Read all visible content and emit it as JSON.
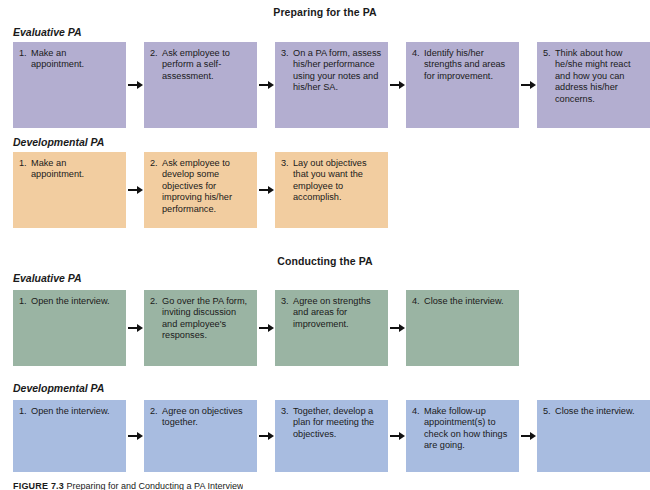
{
  "figure": {
    "caption_label": "FIGURE 7.3",
    "caption_text": "Preparing for and Conducting a PA Interview"
  },
  "colors": {
    "evaluative_preparing": "#b3aed0",
    "developmental_preparing": "#f2cda0",
    "evaluative_conducting": "#9ab4a3",
    "developmental_conducting": "#a8bce0",
    "arrow": "#111111",
    "text": "#1a1a1a",
    "background": "#ffffff"
  },
  "sections": [
    {
      "title": "Preparing for the PA",
      "rows": [
        {
          "label": "Evaluative PA",
          "color": "#b3aed0",
          "steps": [
            {
              "num": "1.",
              "text": "Make an appointment."
            },
            {
              "num": "2.",
              "text": "Ask employee to perform a self-assessment."
            },
            {
              "num": "3.",
              "text": "On a PA form, assess his/her performance using your notes and his/her SA."
            },
            {
              "num": "4.",
              "text": "Identify his/her strengths and areas for improvement."
            },
            {
              "num": "5.",
              "text": "Think about how he/she might react and how you can address his/her concerns."
            }
          ]
        },
        {
          "label": "Developmental PA",
          "color": "#f2cda0",
          "steps": [
            {
              "num": "1.",
              "text": "Make an appointment."
            },
            {
              "num": "2.",
              "text": "Ask employee to develop some objectives for improving his/her performance."
            },
            {
              "num": "3.",
              "text": "Lay out objectives that you want the employee to accomplish."
            }
          ]
        }
      ]
    },
    {
      "title": "Conducting the PA",
      "rows": [
        {
          "label": "Evaluative PA",
          "color": "#9ab4a3",
          "steps": [
            {
              "num": "1.",
              "text": "Open the interview."
            },
            {
              "num": "2.",
              "text": "Go over the PA form, inviting discussion and employee's responses."
            },
            {
              "num": "3.",
              "text": "Agree on strengths and areas for improvement."
            },
            {
              "num": "4.",
              "text": "Close the interview."
            }
          ]
        },
        {
          "label": "Developmental PA",
          "color": "#a8bce0",
          "steps": [
            {
              "num": "1.",
              "text": "Open the interview."
            },
            {
              "num": "2.",
              "text": "Agree on objectives together."
            },
            {
              "num": "3.",
              "text": "Together, develop a plan for meeting the objectives."
            },
            {
              "num": "4.",
              "text": "Make follow-up appointment(s) to check on how things are going."
            },
            {
              "num": "5.",
              "text": "Close the interview."
            }
          ]
        }
      ]
    }
  ],
  "layout": {
    "section_title_tops": [
      6,
      255
    ],
    "row_label_tops": [
      26,
      136,
      272,
      382
    ],
    "row_track_tops": [
      42,
      152,
      290,
      400
    ],
    "row_track_heights": [
      86,
      76,
      76,
      72
    ]
  }
}
